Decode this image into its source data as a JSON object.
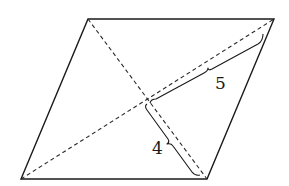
{
  "figure": {
    "type": "parallelogram-with-diagonals",
    "vertices": {
      "top_left": [
        88,
        19
      ],
      "top_right": [
        274,
        19
      ],
      "bottom_right": [
        207,
        179
      ],
      "bottom_left": [
        21,
        179
      ]
    },
    "intersection": [
      147,
      100
    ],
    "labels": {
      "upper_half_diagonal": "5",
      "lower_half_diagonal": "4"
    },
    "colors": {
      "stroke": "#1a1a1a",
      "background": "#ffffff"
    }
  }
}
